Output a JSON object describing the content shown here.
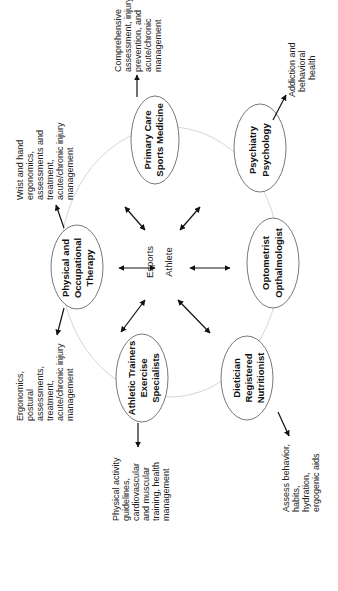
{
  "center": {
    "line1": "Esports",
    "line2": "Athlete"
  },
  "nodes": [
    {
      "id": "primary-care",
      "lines": [
        "Primary Care",
        "Sports Medicine"
      ],
      "description": [
        "Comprehensive",
        "assessment, injury",
        "prevention, and",
        "acute/chronic",
        "management"
      ]
    },
    {
      "id": "psychiatry",
      "lines": [
        "Psychiatry",
        "Psychology"
      ],
      "description": [
        "Addiction and",
        "behavioral",
        "health"
      ]
    },
    {
      "id": "physical-occupational",
      "lines": [
        "Physical and",
        "Occupational",
        "Therapy"
      ],
      "description_upper": [
        "Wrist and hand",
        "ergonomics,",
        "assessments and",
        "treatment,",
        "acute/chronic injury",
        "management"
      ],
      "description_lower": [
        "Ergonomics,",
        "postural",
        "assessments,",
        "treatment,",
        "acute/chronic injury",
        "management"
      ]
    },
    {
      "id": "optometrist",
      "lines": [
        "Optometrist",
        "Opthalmologist"
      ]
    },
    {
      "id": "athletic-trainers",
      "lines": [
        "Athletic Trainers",
        "Exercise",
        "Specialists"
      ],
      "description": [
        "Physical activity",
        "guidelines,",
        "cardiovascular",
        "and muscular",
        "training, health",
        "management"
      ]
    },
    {
      "id": "dietician",
      "lines": [
        "Dietician",
        "Registered",
        "Nutritionist"
      ],
      "description": [
        "Assess behavior,",
        "habits,",
        "hydration,",
        "ergogenic aids"
      ]
    }
  ],
  "colors": {
    "ring": "#d6d6d6",
    "ellipse_stroke": "#555555",
    "arrow": "#111111",
    "text": "#111111"
  }
}
